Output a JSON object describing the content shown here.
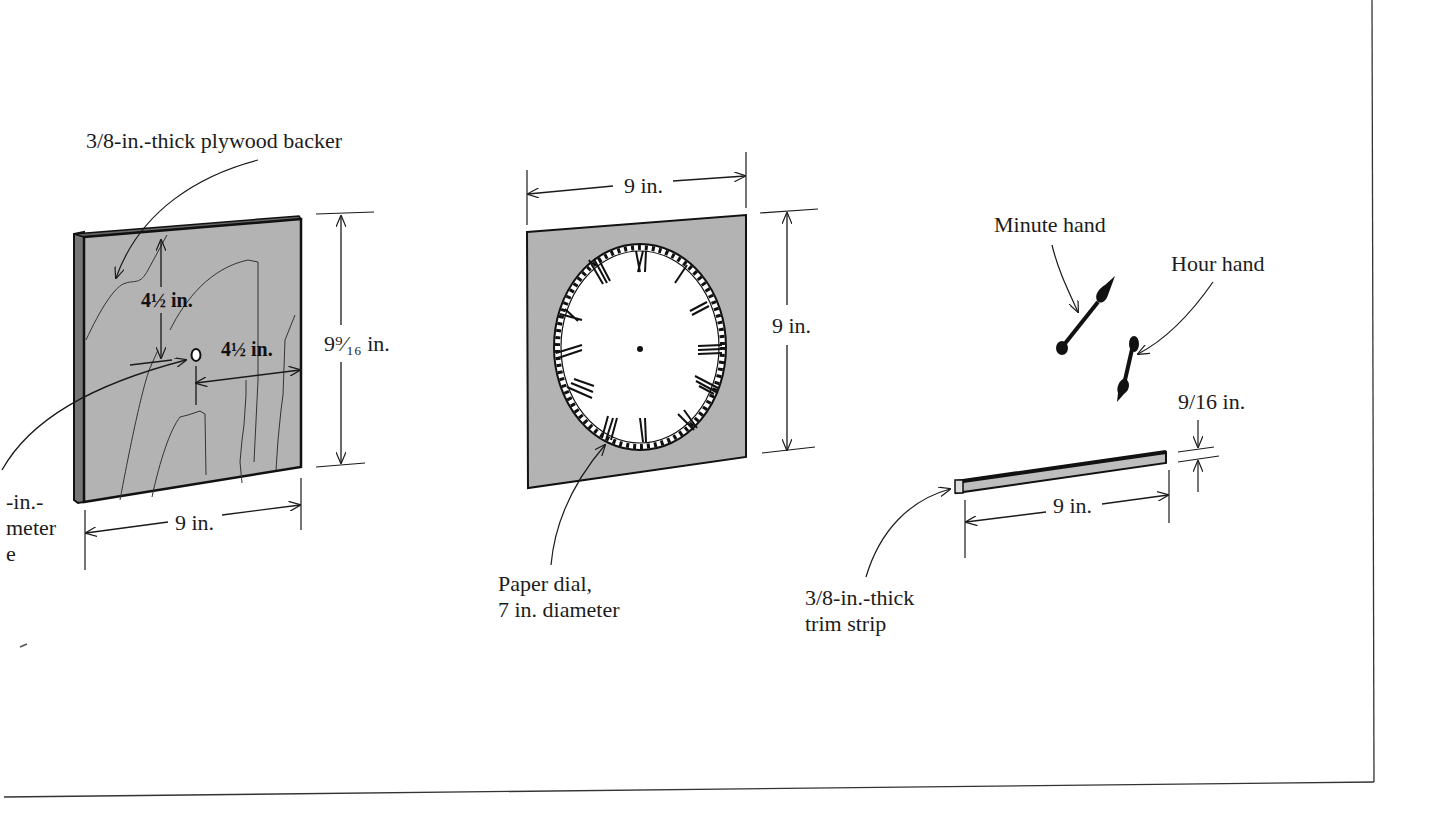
{
  "figure": {
    "colors": {
      "background": "#ffffff",
      "panel_fill": "#b3b3b3",
      "line": "#1a1a1a",
      "dial_face": "#ffffff",
      "trim_fill": "#bdbdbd"
    }
  },
  "backer": {
    "callout": "3/8-in.-thick plywood backer",
    "hole_offset_vertical": "4½ in.",
    "hole_offset_horizontal": "4½ in.",
    "height": "9⁹⁄₁₆ in.",
    "width": "9 in.",
    "hole_callout_line1": "-in.-",
    "hole_callout_line2": "meter",
    "hole_callout_line3": "e"
  },
  "dial": {
    "width": "9 in.",
    "height": "9 in.",
    "callout_line1": "Paper dial,",
    "callout_line2": "7 in. diameter",
    "numerals": [
      "XII",
      "I",
      "II",
      "III",
      "IIII",
      "V",
      "VI",
      "VII",
      "VIII",
      "IX",
      "X",
      "XI"
    ]
  },
  "hands": {
    "minute_label": "Minute hand",
    "hour_label": "Hour hand"
  },
  "trim": {
    "thickness": "9/16 in.",
    "length": "9 in.",
    "callout_line1": "3/8-in.-thick",
    "callout_line2": "trim strip"
  }
}
